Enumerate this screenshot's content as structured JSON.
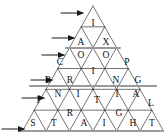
{
  "figure": {
    "type": "diagram",
    "background_color": "#ffffff",
    "line_color": "#3a3a3a",
    "highlight_line_color": "#9a9a9a",
    "letter_color": "#111111",
    "apex": {
      "x": 93,
      "y": 6
    },
    "base_left": {
      "x": 20,
      "y": 131
    },
    "base_right": {
      "x": 161,
      "y": 131
    },
    "rows": 6
  },
  "words": [
    {
      "row": 1,
      "text": "I",
      "letters": [
        "I"
      ]
    },
    {
      "row": 2,
      "text": "AX",
      "letters": [
        "A",
        "X"
      ]
    },
    {
      "row": 3,
      "text": "COOP",
      "letters": [
        "C",
        "O",
        "O",
        "P"
      ]
    },
    {
      "row": 4,
      "text": "BRING",
      "letters": [
        "B",
        "R",
        "I",
        "N",
        "G"
      ]
    },
    {
      "row": 5,
      "text": "INITIAL",
      "letters": [
        "I",
        "N",
        "I",
        "T",
        "I",
        "A",
        "L"
      ]
    },
    {
      "row": 6,
      "text": "STRAIGHT",
      "letters": [
        "S",
        "T",
        "R",
        "A",
        "I",
        "G",
        "H",
        "T"
      ]
    }
  ],
  "letter_cells": [
    {
      "id": "r1-c1",
      "char": "I",
      "x": 93,
      "y": 24,
      "row": 1,
      "orientation": "up"
    },
    {
      "id": "r2-c1",
      "char": "A",
      "x": 81,
      "y": 43,
      "row": 2,
      "orientation": "up"
    },
    {
      "id": "r2-c2",
      "char": "X",
      "x": 106,
      "y": 43,
      "row": 2,
      "orientation": "down"
    },
    {
      "id": "r3-c1",
      "char": "C",
      "x": 60,
      "y": 63,
      "row": 3,
      "orientation": "up"
    },
    {
      "id": "r3-c2",
      "char": "O",
      "x": 81,
      "y": 56,
      "row": 3,
      "orientation": "down"
    },
    {
      "id": "r3-c3",
      "char": "O",
      "x": 106,
      "y": 56,
      "row": 3,
      "orientation": "down"
    },
    {
      "id": "r3-c4",
      "char": "P",
      "x": 127,
      "y": 63,
      "row": 3,
      "orientation": "up"
    },
    {
      "id": "r4-c1",
      "char": "B",
      "x": 48,
      "y": 81,
      "row": 4,
      "orientation": "up"
    },
    {
      "id": "r4-c2",
      "char": "R",
      "x": 70,
      "y": 81,
      "row": 4,
      "orientation": "down"
    },
    {
      "id": "r4-c3",
      "char": "I",
      "x": 93,
      "y": 72,
      "row": 4,
      "orientation": "up"
    },
    {
      "id": "r4-c4",
      "char": "N",
      "x": 116,
      "y": 81,
      "row": 4,
      "orientation": "down"
    },
    {
      "id": "r4-c5",
      "char": "G",
      "x": 138,
      "y": 81,
      "row": 4,
      "orientation": "up"
    },
    {
      "id": "r5-c1",
      "char": "I",
      "x": 38,
      "y": 101,
      "row": 5,
      "orientation": "up"
    },
    {
      "id": "r5-c2",
      "char": "N",
      "x": 58,
      "y": 95,
      "row": 5,
      "orientation": "down"
    },
    {
      "id": "r5-c3",
      "char": "I",
      "x": 78,
      "y": 95,
      "row": 5,
      "orientation": "up"
    },
    {
      "id": "r5-c4",
      "char": "T",
      "x": 97,
      "y": 101,
      "row": 5,
      "orientation": "down"
    },
    {
      "id": "r5-c5",
      "char": "I",
      "x": 117,
      "y": 95,
      "row": 5,
      "orientation": "up"
    },
    {
      "id": "r5-c6",
      "char": "A",
      "x": 136,
      "y": 95,
      "row": 5,
      "orientation": "down"
    },
    {
      "id": "r5-c7",
      "char": "L",
      "x": 151,
      "y": 104,
      "row": 5,
      "orientation": "up"
    },
    {
      "id": "r6-c1",
      "char": "S",
      "x": 33,
      "y": 124,
      "row": 6,
      "orientation": "up"
    },
    {
      "id": "r6-c2",
      "char": "T",
      "x": 54,
      "y": 124,
      "row": 6,
      "orientation": "down"
    },
    {
      "id": "r6-c3",
      "char": "R",
      "x": 70,
      "y": 114,
      "row": 6,
      "orientation": "up"
    },
    {
      "id": "r6-c4",
      "char": "A",
      "x": 84,
      "y": 124,
      "row": 6,
      "orientation": "down"
    },
    {
      "id": "r6-c5",
      "char": "I",
      "x": 104,
      "y": 124,
      "row": 6,
      "orientation": "up"
    },
    {
      "id": "r6-c6",
      "char": "G",
      "x": 119,
      "y": 114,
      "row": 6,
      "orientation": "down"
    },
    {
      "id": "r6-c7",
      "char": "H",
      "x": 133,
      "y": 124,
      "row": 6,
      "orientation": "up"
    },
    {
      "id": "r6-c8",
      "char": "T",
      "x": 152,
      "y": 124,
      "row": 6,
      "orientation": "down"
    }
  ],
  "arrows": [
    {
      "id": "arrow-row-1",
      "row": 1,
      "x1": 61,
      "x2": 83,
      "y": 13
    },
    {
      "id": "arrow-row-2",
      "row": 2,
      "x1": 52,
      "x2": 74,
      "y": 38
    },
    {
      "id": "arrow-row-3",
      "row": 3,
      "x1": 42,
      "x2": 64,
      "y": 55
    },
    {
      "id": "arrow-row-4",
      "row": 4,
      "x1": 31,
      "x2": 52,
      "y": 80
    },
    {
      "id": "arrow-row-5",
      "row": 5,
      "x1": 22,
      "x2": 44,
      "y": 98
    },
    {
      "id": "arrow-row-6",
      "row": 6,
      "x1": 2,
      "x2": 24,
      "y": 129
    }
  ],
  "highlight_lines": [
    {
      "id": "rule-row-2",
      "x1": 66,
      "x2": 120,
      "y": 48
    },
    {
      "id": "rule-row-4",
      "x1": 30,
      "x2": 156,
      "y": 86
    },
    {
      "id": "rule-row-6",
      "x1": 20,
      "x2": 161,
      "y": 131
    }
  ]
}
